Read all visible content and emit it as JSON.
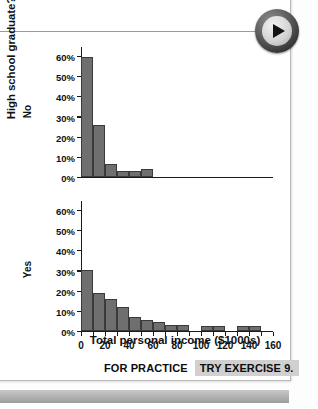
{
  "media": {
    "play_button_icon": "play-icon"
  },
  "chart_data": {
    "type": "bar",
    "title": "",
    "subtitle": "",
    "xlabel": "Total personal income ($1000s)",
    "ylabel": "High school graduate?",
    "xlim": [
      0,
      160
    ],
    "ylim": [
      0,
      65
    ],
    "grid": false,
    "legend_position": "none",
    "xticks": [
      0,
      10,
      20,
      30,
      40,
      50,
      60,
      70,
      80,
      90,
      100,
      110,
      120,
      130,
      140,
      150,
      160
    ],
    "xtick_labels": [
      "0",
      "",
      "20",
      "",
      "40",
      "",
      "60",
      "",
      "80",
      "",
      "100",
      "",
      "120",
      "",
      "140",
      "",
      "160"
    ],
    "yticks": [
      0,
      10,
      20,
      30,
      40,
      50,
      60
    ],
    "ytick_labels": [
      "0%",
      "10%",
      "20%",
      "30%",
      "40%",
      "50%",
      "60%"
    ],
    "panels": [
      {
        "name": "No",
        "label": "No",
        "bin_width": 10,
        "bins": [
          {
            "x0": 0,
            "x1": 10,
            "value": 59.5
          },
          {
            "x0": 10,
            "x1": 20,
            "value": 26.0
          },
          {
            "x0": 20,
            "x1": 30,
            "value": 6.5
          },
          {
            "x0": 30,
            "x1": 40,
            "value": 3.0
          },
          {
            "x0": 40,
            "x1": 50,
            "value": 3.2
          },
          {
            "x0": 50,
            "x1": 60,
            "value": 4.2
          }
        ]
      },
      {
        "name": "Yes",
        "label": "Yes",
        "bin_width": 10,
        "bins": [
          {
            "x0": 0,
            "x1": 10,
            "value": 30.3
          },
          {
            "x0": 10,
            "x1": 20,
            "value": 19.2
          },
          {
            "x0": 20,
            "x1": 30,
            "value": 16.2
          },
          {
            "x0": 30,
            "x1": 40,
            "value": 12.0
          },
          {
            "x0": 40,
            "x1": 50,
            "value": 7.0
          },
          {
            "x0": 50,
            "x1": 60,
            "value": 5.8
          },
          {
            "x0": 60,
            "x1": 70,
            "value": 4.8
          },
          {
            "x0": 70,
            "x1": 80,
            "value": 3.0
          },
          {
            "x0": 80,
            "x1": 90,
            "value": 2.9
          },
          {
            "x0": 100,
            "x1": 110,
            "value": 2.4
          },
          {
            "x0": 110,
            "x1": 120,
            "value": 2.4
          },
          {
            "x0": 130,
            "x1": 140,
            "value": 2.5
          },
          {
            "x0": 140,
            "x1": 150,
            "value": 2.6
          }
        ]
      }
    ],
    "colors": {
      "bar_fill": "#6f6f6f",
      "bar_edge": "#3a3a3a",
      "axis": "#1a1a1a",
      "text": "#111111"
    }
  },
  "footer": {
    "for_practice_label": "FOR PRACTICE",
    "try_exercise_label": "TRY EXERCISE 9."
  }
}
